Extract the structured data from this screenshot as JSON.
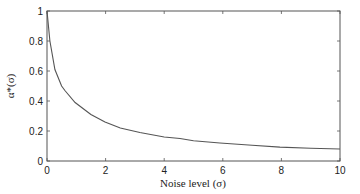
{
  "chart_data": {
    "type": "line",
    "title": "",
    "xlabel": "Noise level (σ)",
    "ylabel": "α*(σ)",
    "xlim": [
      0,
      10
    ],
    "ylim": [
      0,
      1
    ],
    "x_ticks": [
      "0",
      "2",
      "4",
      "6",
      "8",
      "10"
    ],
    "y_ticks": [
      "0",
      "0.2",
      "0.4",
      "0.6",
      "0.8",
      "1"
    ],
    "grid": false,
    "legend": null,
    "series": [
      {
        "name": "α*(σ)",
        "color": "#555555",
        "x": [
          0,
          0.1,
          0.27,
          0.5,
          0.61,
          0.96,
          1.5,
          1.98,
          2.5,
          3.17,
          4.0,
          4.54,
          5.0,
          5.9,
          7.0,
          7.95,
          9.0,
          10.0
        ],
        "y": [
          1.0,
          0.8,
          0.61,
          0.5,
          0.47,
          0.39,
          0.31,
          0.26,
          0.22,
          0.19,
          0.16,
          0.15,
          0.135,
          0.12,
          0.105,
          0.093,
          0.085,
          0.08
        ]
      }
    ]
  }
}
